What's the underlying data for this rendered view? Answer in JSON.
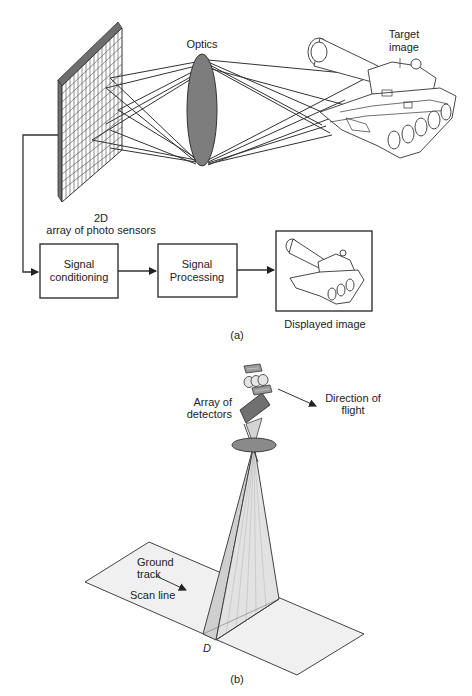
{
  "figure_a": {
    "labels": {
      "optics": "Optics",
      "target_line1": "Target",
      "target_line2": "image",
      "sensor_line1": "2D",
      "sensor_line2": "array of photo sensors",
      "displayed_image": "Displayed image",
      "caption": "(a)"
    },
    "blocks": [
      {
        "line1": "Signal",
        "line2": "conditioning"
      },
      {
        "line1": "Signal",
        "line2": "Processing"
      }
    ]
  },
  "figure_b": {
    "labels": {
      "array_line1": "Array of",
      "array_line2": "detectors",
      "direction_line1": "Direction of",
      "direction_line2": "flight",
      "ground_line1": "Ground",
      "ground_line2": "track",
      "scan_line": "Scan line",
      "d_marker": "D",
      "caption": "(b)"
    }
  },
  "colors": {
    "lens_fill": "#7d7d7d",
    "panel_side": "#6e6e6e",
    "plane_fill": "#f0f0f0",
    "beam_fill": "#d9d9d9",
    "stroke": "#333333"
  }
}
